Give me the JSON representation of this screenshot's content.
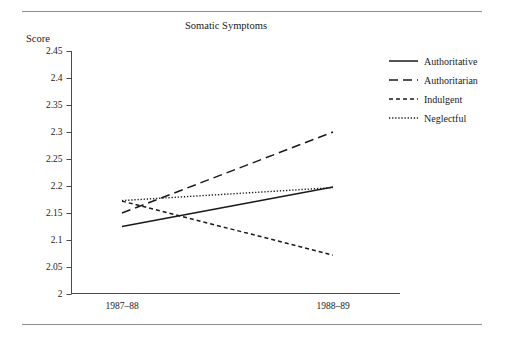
{
  "figure": {
    "title": "Somatic Symptoms",
    "y_axis_title": "Score"
  },
  "chart_data": {
    "type": "line",
    "title": "Somatic Symptoms",
    "xlabel": "",
    "ylabel": "Score",
    "categories": [
      "1987–88",
      "1988–89"
    ],
    "x": [
      0,
      1
    ],
    "ylim": [
      2.0,
      2.45
    ],
    "yticks": [
      2.0,
      2.05,
      2.1,
      2.15,
      2.2,
      2.25,
      2.3,
      2.35,
      2.4,
      2.45
    ],
    "ytick_labels": [
      "2",
      "2.05",
      "2.1",
      "2.15",
      "2.2",
      "2.25",
      "2.3",
      "2.35",
      "2.4",
      "2.45"
    ],
    "grid": false,
    "legend_position": "top-right",
    "series": [
      {
        "name": "Authoritative",
        "line_style": "solid",
        "values": [
          2.125,
          2.198
        ]
      },
      {
        "name": "Authoritarian",
        "line_style": "long-dash",
        "values": [
          2.15,
          2.3
        ]
      },
      {
        "name": "Indulgent",
        "line_style": "short-dash",
        "values": [
          2.172,
          2.072
        ]
      },
      {
        "name": "Neglectful",
        "line_style": "dotted",
        "values": [
          2.173,
          2.197
        ]
      }
    ]
  },
  "legend": {
    "items": [
      {
        "label": "Authoritative"
      },
      {
        "label": "Authoritarian"
      },
      {
        "label": "Indulgent"
      },
      {
        "label": "Neglectful"
      }
    ]
  },
  "colors": {
    "ink": "#1a1a1a",
    "axis": "#4a4a4a",
    "rule": "#8d8d8d",
    "background": "#ffffff"
  }
}
